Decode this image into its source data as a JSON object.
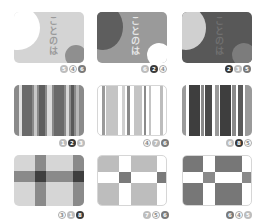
{
  "palette": {
    "white": "#ffffff",
    "light": "#d2d2d2",
    "mid": "#9a9a9a",
    "dark": "#5a5a5a",
    "darker": "#3a3a3a"
  },
  "cards": [
    {
      "id": "circles-light",
      "pattern": "circles",
      "text": "ことのは",
      "badges": [
        {
          "label": "5",
          "style": "light"
        },
        {
          "label": "4",
          "style": "outline"
        },
        {
          "label": "6",
          "style": "mid"
        }
      ]
    },
    {
      "id": "circles-mid",
      "pattern": "circles",
      "text": "ことのは",
      "badges": [
        {
          "label": "6",
          "style": "light"
        },
        {
          "label": "2",
          "style": "dark"
        },
        {
          "label": "4",
          "style": "outline"
        }
      ]
    },
    {
      "id": "circles-dark",
      "pattern": "circles",
      "text": "ことのは",
      "badges": [
        {
          "label": "2",
          "style": "dark"
        },
        {
          "label": "3",
          "style": "light"
        },
        {
          "label": "5",
          "style": "mid"
        }
      ]
    },
    {
      "id": "stripes-mid",
      "pattern": "stripes",
      "badges": [
        {
          "label": "1",
          "style": "light"
        },
        {
          "label": "2",
          "style": "dark"
        },
        {
          "label": "3",
          "style": "light"
        }
      ]
    },
    {
      "id": "stripes-light",
      "pattern": "stripes",
      "badges": [
        {
          "label": "4",
          "style": "outline"
        },
        {
          "label": "7",
          "style": "light"
        },
        {
          "label": "6",
          "style": "mid"
        }
      ]
    },
    {
      "id": "stripes-dark",
      "pattern": "stripes",
      "badges": [
        {
          "label": "6",
          "style": "light"
        },
        {
          "label": "8",
          "style": "dark"
        },
        {
          "label": "5",
          "style": "outline"
        }
      ]
    },
    {
      "id": "plaid-light",
      "pattern": "plaid",
      "badges": [
        {
          "label": "3",
          "style": "outline"
        },
        {
          "label": "1",
          "style": "light"
        },
        {
          "label": "8",
          "style": "dark"
        }
      ]
    },
    {
      "id": "check-light",
      "pattern": "check",
      "badges": [
        {
          "label": "7",
          "style": "light"
        },
        {
          "label": "5",
          "style": "outline"
        },
        {
          "label": "6",
          "style": "mid"
        }
      ]
    },
    {
      "id": "check-dark",
      "pattern": "check",
      "badges": [
        {
          "label": "6",
          "style": "mid"
        },
        {
          "label": "4",
          "style": "outline"
        },
        {
          "label": "5",
          "style": "light"
        }
      ]
    }
  ]
}
